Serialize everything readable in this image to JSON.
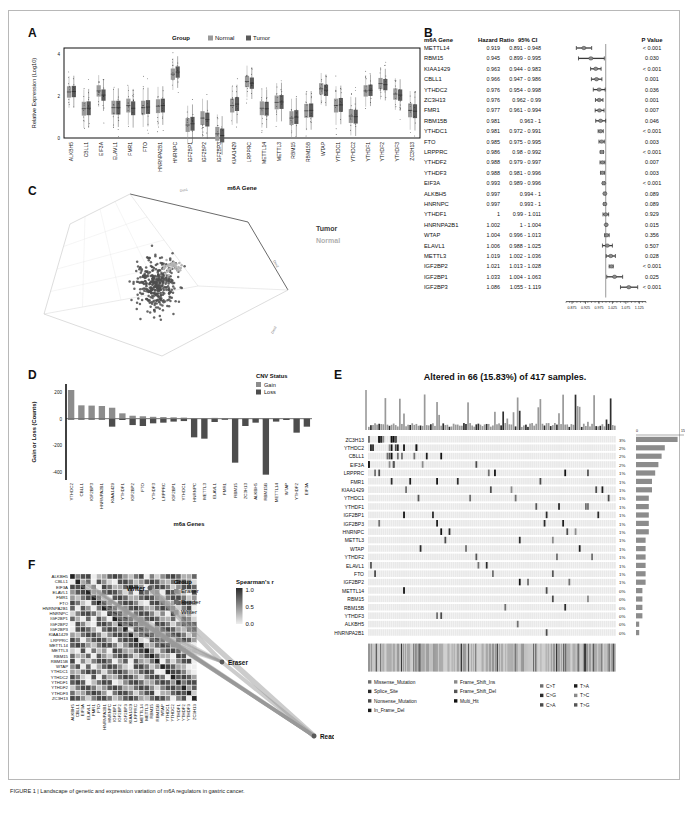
{
  "figure": {
    "caption": "FIGURE 1 | Landscape of genetic and expression variation of m6A regulators in gastric cancer."
  },
  "panelA": {
    "letter": "A",
    "ylabel": "Relative Expression (Log10)",
    "xlabel": "m6A Gene",
    "legend_title": "Group",
    "legend_items": [
      "Normal",
      "Tumor"
    ],
    "colors": {
      "normal": "#9a9a9a",
      "tumor": "#5a5a5a"
    },
    "yticks": [
      "0",
      "2",
      "4"
    ],
    "genes": [
      "ALKBH5",
      "CBLL1",
      "EIF3A",
      "ELAVL1",
      "FMR1",
      "FTO",
      "HNRNPA2B1",
      "HNRNPC",
      "IGF2BP1",
      "IGF2BP2",
      "IGF2BP3",
      "KIAA1429",
      "LRPPRC",
      "METTL14",
      "METTL3",
      "RBM15",
      "RBM15B",
      "WTAP",
      "YTHDC1",
      "YTHDC2",
      "YTHDF1",
      "YTHDF2",
      "YTHDF3",
      "ZC3H13"
    ],
    "chart_data": {
      "type": "box",
      "title": "",
      "xlabel": "m6A Gene",
      "ylabel": "Relative Expression (Log10)",
      "ylim": [
        0,
        4.3
      ],
      "categories": [
        "ALKBH5",
        "CBLL1",
        "EIF3A",
        "ELAVL1",
        "FMR1",
        "FTO",
        "HNRNPA2B1",
        "HNRNPC",
        "IGF2BP1",
        "IGF2BP2",
        "IGF2BP3",
        "KIAA1429",
        "LRPPRC",
        "METTL14",
        "METTL3",
        "RBM15",
        "RBM15B",
        "WTAP",
        "YTHDC1",
        "YTHDC2",
        "YTHDF1",
        "YTHDF2",
        "YTHDF3",
        "ZC3H13"
      ],
      "series": [
        {
          "name": "Normal",
          "median": [
            2.2,
            1.4,
            2.25,
            1.45,
            1.55,
            1.45,
            1.52,
            3.05,
            0.62,
            0.95,
            0.2,
            1.55,
            2.7,
            1.42,
            1.7,
            0.95,
            1.3,
            2.35,
            1.55,
            1.05,
            2.25,
            2.6,
            2.1,
            1.32
          ]
        },
        {
          "name": "Tumor",
          "median": [
            2.22,
            1.42,
            2.05,
            1.45,
            1.42,
            1.48,
            1.55,
            3.15,
            0.68,
            0.88,
            0.12,
            1.62,
            2.62,
            1.4,
            1.72,
            1.0,
            1.32,
            2.28,
            1.58,
            1.02,
            2.28,
            2.55,
            2.05,
            1.28
          ]
        }
      ]
    }
  },
  "panelB": {
    "letter": "B",
    "headers": [
      "m6A Gene",
      "Hazard Ratio",
      "95% CI",
      "P Value"
    ],
    "axis_ticks": [
      "0.875",
      "0.925",
      "0.975",
      "1.025",
      "1.075",
      "1.125"
    ],
    "reference_line": 1.0,
    "chart_data": {
      "type": "forest",
      "title": "",
      "xlabel": "Hazard Ratio",
      "xlim": [
        0.86,
        1.135
      ],
      "rows": [
        {
          "gene": "METTL14",
          "hr": 0.919,
          "ci": "0.891 - 0.948",
          "low": 0.891,
          "high": 0.948,
          "p": "< 0.001"
        },
        {
          "gene": "RBM15",
          "hr": 0.945,
          "ci": "0.899 - 0.995",
          "low": 0.899,
          "high": 0.995,
          "p": "0.030"
        },
        {
          "gene": "KIAA1429",
          "hr": 0.963,
          "ci": "0.944 - 0.983",
          "low": 0.944,
          "high": 0.983,
          "p": "< 0.001"
        },
        {
          "gene": "CBLL1",
          "hr": 0.966,
          "ci": "0.947 - 0.986",
          "low": 0.947,
          "high": 0.986,
          "p": "0.001"
        },
        {
          "gene": "YTHDC2",
          "hr": 0.976,
          "ci": "0.954 - 0.998",
          "low": 0.954,
          "high": 0.998,
          "p": "0.036"
        },
        {
          "gene": "ZC3H13",
          "hr": 0.976,
          "ci": "0.962 - 0.99",
          "low": 0.962,
          "high": 0.99,
          "p": "0.001"
        },
        {
          "gene": "FMR1",
          "hr": 0.977,
          "ci": "0.961 - 0.994",
          "low": 0.961,
          "high": 0.994,
          "p": "0.007"
        },
        {
          "gene": "RBM15B",
          "hr": 0.981,
          "ci": "0.963 - 1",
          "low": 0.963,
          "high": 1.0,
          "p": "0.046"
        },
        {
          "gene": "YTHDC1",
          "hr": 0.981,
          "ci": "0.972 - 0.991",
          "low": 0.972,
          "high": 0.991,
          "p": "< 0.001"
        },
        {
          "gene": "FTO",
          "hr": 0.985,
          "ci": "0.975 - 0.995",
          "low": 0.975,
          "high": 0.995,
          "p": "0.003"
        },
        {
          "gene": "LRPPRC",
          "hr": 0.986,
          "ci": "0.98 - 0.992",
          "low": 0.98,
          "high": 0.992,
          "p": "< 0.001"
        },
        {
          "gene": "YTHDF2",
          "hr": 0.988,
          "ci": "0.979 - 0.997",
          "low": 0.979,
          "high": 0.997,
          "p": "0.007"
        },
        {
          "gene": "YTHDF3",
          "hr": 0.988,
          "ci": "0.981 - 0.996",
          "low": 0.981,
          "high": 0.996,
          "p": "0.003"
        },
        {
          "gene": "EIF3A",
          "hr": 0.993,
          "ci": "0.989 - 0.996",
          "low": 0.989,
          "high": 0.996,
          "p": "< 0.001"
        },
        {
          "gene": "ALKBH5",
          "hr": 0.997,
          "ci": "0.994 - 1",
          "low": 0.994,
          "high": 1.0,
          "p": "0.089"
        },
        {
          "gene": "HNRNPC",
          "hr": 0.997,
          "ci": "0.993 - 1",
          "low": 0.993,
          "high": 1.0,
          "p": "0.089"
        },
        {
          "gene": "YTHDF1",
          "hr": 1,
          "ci": "0.99 - 1.011",
          "low": 0.99,
          "high": 1.011,
          "p": "0.929"
        },
        {
          "gene": "HNRNPA2B1",
          "hr": 1.002,
          "ci": "1 - 1.004",
          "low": 1.0,
          "high": 1.004,
          "p": "0.015"
        },
        {
          "gene": "WTAP",
          "hr": 1.004,
          "ci": "0.996 - 1.013",
          "low": 0.996,
          "high": 1.013,
          "p": "0.356"
        },
        {
          "gene": "ELAVL1",
          "hr": 1.006,
          "ci": "0.988 - 1.025",
          "low": 0.988,
          "high": 1.025,
          "p": "0.507"
        },
        {
          "gene": "METTL3",
          "hr": 1.019,
          "ci": "1.002 - 1.036",
          "low": 1.002,
          "high": 1.036,
          "p": "0.028"
        },
        {
          "gene": "IGF2BP2",
          "hr": 1.021,
          "ci": "1.013 - 1.028",
          "low": 1.013,
          "high": 1.028,
          "p": "< 0.001"
        },
        {
          "gene": "IGF2BP1",
          "hr": 1.033,
          "ci": "1.004 - 1.063",
          "low": 1.004,
          "high": 1.063,
          "p": "0.025"
        },
        {
          "gene": "IGF2BP3",
          "hr": 1.086,
          "ci": "1.055 - 1.119",
          "low": 1.055,
          "high": 1.119,
          "p": "< 0.001"
        }
      ]
    }
  },
  "panelC": {
    "letter": "C",
    "labels": {
      "tumor": "Tumor",
      "normal": "Normal"
    },
    "axes": [
      "Dim1",
      "Dim2",
      "Dim3"
    ],
    "colors": {
      "tumor": "#555555",
      "normal": "#b0b0b0"
    },
    "chart_data": {
      "type": "scatter3d",
      "title": "",
      "groups": [
        {
          "name": "Tumor",
          "n": 375,
          "color": "#555555"
        },
        {
          "name": "Normal",
          "n": 32,
          "color": "#b0b0b0"
        }
      ]
    }
  },
  "panelD": {
    "letter": "D",
    "ylabel": "Gain or Loss (Counts)",
    "xlabel": "m6a Genes",
    "legend_title": "CNV Status",
    "legend_items": [
      "Gain",
      "Loss"
    ],
    "colors": {
      "gain": "#8c8c8c",
      "loss": "#4d4d4d"
    },
    "yticks": [
      "200",
      "0",
      "-200",
      "-400"
    ],
    "chart_data": {
      "type": "bar",
      "title": "",
      "xlabel": "m6a Genes",
      "ylabel": "Gain or Loss (Counts)",
      "ylim": [
        -460,
        260
      ],
      "categories": [
        "YTHDC2",
        "CBLL1",
        "IGF2BP3",
        "HNRNPA2B1",
        "KIAA1429",
        "YTHDF1",
        "IGF2BP2",
        "FTO",
        "YTHDF3",
        "LRPPRC",
        "IGF2BP1",
        "YTHDC1",
        "HNRNPC",
        "METTL3",
        "ELAVL1",
        "FMR1",
        "RBM15",
        "ZC3H13",
        "ALKBH5",
        "RBM15B",
        "METTL14",
        "WTAP",
        "YTHDF2",
        "EIF3A"
      ],
      "series": [
        {
          "name": "Gain",
          "values": [
            215,
            100,
            98,
            95,
            82,
            40,
            22,
            18,
            14,
            12,
            10,
            8,
            5,
            4,
            6,
            3,
            2,
            2,
            2,
            2,
            2,
            2,
            2,
            2
          ]
        },
        {
          "name": "Loss",
          "values": [
            -5,
            -4,
            -5,
            -6,
            -60,
            -10,
            -48,
            -55,
            -35,
            -30,
            -22,
            -18,
            -140,
            -150,
            -25,
            -8,
            -330,
            -55,
            -30,
            -420,
            -22,
            -10,
            -105,
            -60
          ]
        }
      ]
    }
  },
  "panelE": {
    "letter": "E",
    "title": "Altered in 66 (15.83%) of 417 samples.",
    "barscale": [
      "0",
      "15"
    ],
    "genes": [
      "ZC3H13",
      "YTHDC2",
      "CBLL1",
      "EIF3A",
      "LRPPRC",
      "FMR1",
      "KIAA1429",
      "YTHDC1",
      "YTHDF1",
      "IGF2BP1",
      "IGF2BP3",
      "HNRNPC",
      "METTL3",
      "WTAP",
      "YTHDF2",
      "ELAVL1",
      "FTO",
      "IGF2BP2",
      "METTL14",
      "RBM15",
      "RBM15B",
      "YTHDF3",
      "ALKBH5",
      "HNRNPA2B1"
    ],
    "percentages": [
      "3%",
      "2%",
      "2%",
      "2%",
      "1%",
      "1%",
      "1%",
      "1%",
      "1%",
      "1%",
      "1%",
      "1%",
      "1%",
      "1%",
      "1%",
      "1%",
      "1%",
      "1%",
      "0%",
      "0%",
      "0%",
      "0%",
      "0%",
      "0%"
    ],
    "legend_mutation": [
      "Missense_Mutation",
      "Splice_Site",
      "Nonsense_Mutation",
      "In_Frame_Del",
      "Frame_Shift_Ins",
      "Frame_Shift_Del",
      "Multi_Hit"
    ],
    "legend_substitution": [
      "C>T",
      "C>G",
      "C>A",
      "T>A",
      "T>C",
      "T>G"
    ],
    "chart_data": {
      "type": "oncoprint",
      "title": "Altered in 66 (15.83%) of 417 samples.",
      "samples": 417,
      "altered_samples": 66,
      "altered_percent": 15.83,
      "genes": [
        "ZC3H13",
        "YTHDC2",
        "CBLL1",
        "EIF3A",
        "LRPPRC",
        "FMR1",
        "KIAA1429",
        "YTHDC1",
        "YTHDF1",
        "IGF2BP1",
        "IGF2BP3",
        "HNRNPC",
        "METTL3",
        "WTAP",
        "YTHDF2",
        "ELAVL1",
        "FTO",
        "IGF2BP2",
        "METTL14",
        "RBM15",
        "RBM15B",
        "YTHDF3",
        "ALKBH5",
        "HNRNPA2B1"
      ],
      "gene_percent": [
        3,
        2,
        2,
        2,
        1,
        1,
        1,
        1,
        1,
        1,
        1,
        1,
        1,
        1,
        1,
        1,
        1,
        1,
        0,
        0,
        0,
        0,
        0,
        0
      ],
      "gene_counts": [
        13,
        9,
        8,
        7,
        6,
        5,
        5,
        4,
        4,
        4,
        4,
        4,
        3,
        3,
        3,
        3,
        3,
        3,
        2,
        2,
        2,
        2,
        1,
        1
      ],
      "tmb_axis": [
        0,
        15
      ]
    }
  },
  "panelF": {
    "letter": "F",
    "legend_group_title": "Group",
    "legend_group_items": [
      "Eraser",
      "Reader",
      "Writer"
    ],
    "legend_scale_title": "Spearman's r",
    "legend_scale_ticks": [
      "1.0",
      "0.5",
      "0.0"
    ],
    "node_labels": [
      "Writer",
      "Eraser",
      "Reader"
    ],
    "genes": [
      "ALKBH5",
      "CBLL1",
      "EIF3A",
      "ELAVL1",
      "FMR1",
      "FTO",
      "HNRNPA2B1",
      "HNRNPC",
      "IGF2BP1",
      "IGF2BP2",
      "IGF2BP3",
      "KIAA1429",
      "LRPPRC",
      "METTL14",
      "METTL3",
      "RBM15",
      "RBM15B",
      "WTAP",
      "YTHDC1",
      "YTHDC2",
      "YTHDF1",
      "YTHDF2",
      "YTHDF3",
      "ZC3H13"
    ],
    "chart_data": {
      "type": "heatmap",
      "title": "",
      "xlabel": "",
      "ylabel": "",
      "rows": [
        "ALKBH5",
        "CBLL1",
        "EIF3A",
        "ELAVL1",
        "FMR1",
        "FTO",
        "HNRNPA2B1",
        "HNRNPC",
        "IGF2BP1",
        "IGF2BP2",
        "IGF2BP3",
        "KIAA1429",
        "LRPPRC",
        "METTL14",
        "METTL3",
        "RBM15",
        "RBM15B",
        "WTAP",
        "YTHDC1",
        "YTHDC2",
        "YTHDF1",
        "YTHDF2",
        "YTHDF3",
        "ZC3H13"
      ],
      "cols": [
        "ALKBH5",
        "CBLL1",
        "EIF3A",
        "ELAVL1",
        "FMR1",
        "FTO",
        "HNRNPA2B1",
        "HNRNPC",
        "IGF2BP1",
        "IGF2BP2",
        "IGF2BP3",
        "KIAA1429",
        "LRPPRC",
        "METTL14",
        "METTL3",
        "RBM15",
        "RBM15B",
        "WTAP",
        "YTHDC1",
        "YTHDC2",
        "YTHDF1",
        "YTHDF2",
        "YTHDF3",
        "ZC3H13"
      ],
      "scale": [
        0.0,
        1.0
      ],
      "colorscale": [
        "#f2f2f2",
        "#222222"
      ]
    }
  }
}
